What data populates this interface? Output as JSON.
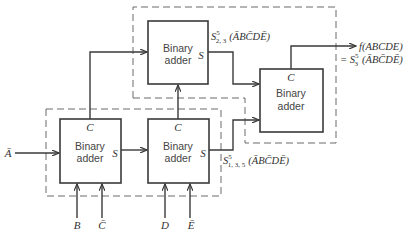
{
  "diagram": {
    "type": "block-diagram",
    "blocks": [
      {
        "id": "adder-top",
        "label_line1": "Binary",
        "label_line2": "adder",
        "pin_s": "S"
      },
      {
        "id": "adder-right",
        "label_line1": "Binary",
        "label_line2": "adder",
        "pin_c": "C"
      },
      {
        "id": "adder-bottom-left",
        "label_line1": "Binary",
        "label_line2": "adder",
        "pin_c": "C",
        "pin_s": "S"
      },
      {
        "id": "adder-bottom-mid",
        "label_line1": "Binary",
        "label_line2": "adder",
        "pin_c": "C",
        "pin_s": "S"
      }
    ],
    "inputs": {
      "a_bar": "Ā",
      "b": "B",
      "c_bar": "C̄",
      "d": "D",
      "e_bar": "Ē"
    },
    "annotations": {
      "s23_main": "S",
      "s23_sup": "5",
      "s23_sub": "2, 3",
      "s23_expr": "(ĀBC̄DĒ)",
      "s135_main": "S",
      "s135_sup": "5",
      "s135_sub": "1, 3, 5",
      "s135_expr": "(ĀBC̄DĒ)",
      "output_f": "f(ABCDE)",
      "output_eq": "= S",
      "output_sup": "5",
      "output_sub": "3",
      "output_expr": "(ĀBC̄DĒ)"
    }
  }
}
